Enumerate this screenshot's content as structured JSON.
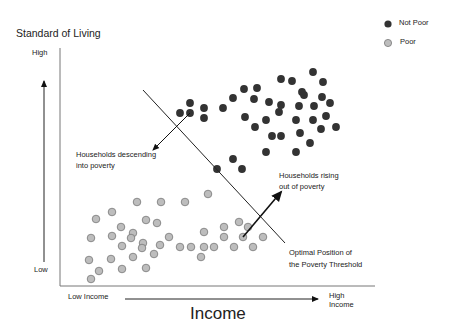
{
  "chart_data": {
    "type": "scatter",
    "title": "",
    "ylabel": "Standard of Living",
    "xlabel": "Income",
    "y_ticks": {
      "high": "High",
      "low": "Low"
    },
    "x_ticks": {
      "low": "Low Income",
      "high": "High Income"
    },
    "legend": [
      {
        "name": "Not Poor",
        "color": "#333333"
      },
      {
        "name": "Poor",
        "color": "#bdbdbd"
      }
    ],
    "annotations": [
      "Households descending into poverty",
      "Households rising out of poverty",
      "Optimal Position of the Poverty Threshold"
    ],
    "series": [
      {
        "name": "Not Poor",
        "color": "#333333",
        "points": [
          [
            190,
            103
          ],
          [
            180,
            113
          ],
          [
            190,
            113
          ],
          [
            204,
            108
          ],
          [
            204,
            118
          ],
          [
            223,
            108
          ],
          [
            233,
            98
          ],
          [
            244,
            89
          ],
          [
            257,
            88
          ],
          [
            254,
            99
          ],
          [
            245,
            117
          ],
          [
            255,
            127
          ],
          [
            266,
            120
          ],
          [
            269,
            102
          ],
          [
            281,
            79
          ],
          [
            292,
            81
          ],
          [
            281,
            105
          ],
          [
            279,
            112
          ],
          [
            302,
            92
          ],
          [
            304,
            95
          ],
          [
            299,
            106
          ],
          [
            296,
            120
          ],
          [
            300,
            133
          ],
          [
            272,
            136
          ],
          [
            281,
            136
          ],
          [
            266,
            152
          ],
          [
            296,
            152
          ],
          [
            233,
            159
          ],
          [
            242,
            169
          ],
          [
            217,
            169
          ],
          [
            313,
            72
          ],
          [
            323,
            82
          ],
          [
            322,
            97
          ],
          [
            314,
            106
          ],
          [
            330,
            103
          ],
          [
            313,
            120
          ],
          [
            326,
            116
          ],
          [
            336,
            127
          ],
          [
            321,
            129
          ],
          [
            310,
            143
          ]
        ]
      },
      {
        "name": "Poor",
        "color": "#bdbdbd",
        "points": [
          [
            137,
            202
          ],
          [
            161,
            202
          ],
          [
            185,
            202
          ],
          [
            208,
            194
          ],
          [
            112,
            212
          ],
          [
            96,
            219
          ],
          [
            146,
            220
          ],
          [
            157,
            223
          ],
          [
            121,
            227
          ],
          [
            133,
            233
          ],
          [
            91,
            238
          ],
          [
            112,
            236
          ],
          [
            131,
            238
          ],
          [
            169,
            237
          ],
          [
            122,
            246
          ],
          [
            143,
            243
          ],
          [
            142,
            248
          ],
          [
            160,
            245
          ],
          [
            180,
            247
          ],
          [
            191,
            247
          ],
          [
            133,
            257
          ],
          [
            154,
            254
          ],
          [
            89,
            260
          ],
          [
            111,
            259
          ],
          [
            99,
            271
          ],
          [
            122,
            269
          ],
          [
            146,
            268
          ],
          [
            91,
            279
          ],
          [
            239,
            222
          ],
          [
            224,
            227
          ],
          [
            248,
            227
          ],
          [
            204,
            232
          ],
          [
            224,
            237
          ],
          [
            243,
            237
          ],
          [
            263,
            237
          ],
          [
            204,
            247
          ],
          [
            214,
            247
          ],
          [
            234,
            247
          ],
          [
            253,
            247
          ],
          [
            201,
            257
          ]
        ]
      }
    ],
    "threshold_line": {
      "x1": 143,
      "y1": 90,
      "x2": 285,
      "y2": 243
    },
    "arrows": [
      {
        "name": "descending",
        "x1": 190,
        "y1": 113,
        "x2": 153,
        "y2": 150
      },
      {
        "name": "rising",
        "x1": 243,
        "y1": 237,
        "x2": 281,
        "y2": 192
      }
    ]
  },
  "labels": {
    "y_title": "Standard of Living",
    "y_high": "High",
    "y_low": "Low",
    "x_low": "Low Income",
    "x_high_1": "High",
    "x_high_2": "Income",
    "x_title": "Income",
    "legend_not_poor": "Not Poor",
    "legend_poor": "Poor",
    "desc_1": "Households descending",
    "desc_2": "into poverty",
    "rise_1": "Households rising",
    "rise_2": "out of  poverty",
    "thr_1": "Optimal Position of",
    "thr_2": "the Poverty Threshold"
  }
}
